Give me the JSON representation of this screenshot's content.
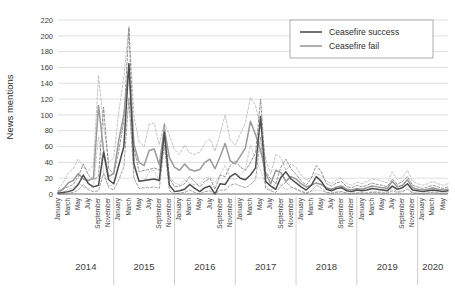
{
  "chart_data": {
    "type": "line",
    "title": "",
    "xlabel": "",
    "ylabel": "News mentions",
    "ylim": [
      0,
      220
    ],
    "ytick_step": 20,
    "yticks": [
      0,
      20,
      40,
      60,
      80,
      100,
      120,
      140,
      160,
      180,
      200,
      220
    ],
    "grid": "horizontal",
    "legend_position": "top-right",
    "legend": [
      {
        "name": "Ceasefire success",
        "color": "#4d4d4d",
        "style": "solid"
      },
      {
        "name": "Ceasefire fail",
        "color": "#9a9a9a",
        "style": "solid"
      }
    ],
    "month_tick_labels": [
      "January",
      "March",
      "May",
      "July",
      "September",
      "November"
    ],
    "year_groups": [
      {
        "year": "2014",
        "months": [
          "January",
          "March",
          "May",
          "July",
          "September",
          "November"
        ]
      },
      {
        "year": "2015",
        "months": [
          "January",
          "March",
          "May",
          "July",
          "September",
          "November"
        ]
      },
      {
        "year": "2016",
        "months": [
          "January",
          "March",
          "May",
          "July",
          "September",
          "November"
        ]
      },
      {
        "year": "2017",
        "months": [
          "January",
          "March",
          "May",
          "July",
          "September",
          "November"
        ]
      },
      {
        "year": "2018",
        "months": [
          "January",
          "March",
          "May",
          "July",
          "September",
          "November"
        ]
      },
      {
        "year": "2019",
        "months": [
          "January",
          "March",
          "May",
          "July",
          "September",
          "November"
        ]
      },
      {
        "year": "2020",
        "months": [
          "January",
          "March",
          "May"
        ]
      }
    ],
    "x_start": "2014-01",
    "x_end": "2020-06",
    "n_points": 78,
    "series": [
      {
        "name": "Ceasefire success",
        "color": "#4d4d4d",
        "style": "solid",
        "values": [
          1,
          2,
          3,
          5,
          12,
          24,
          13,
          9,
          11,
          53,
          18,
          13,
          36,
          60,
          165,
          38,
          16,
          17,
          18,
          19,
          17,
          78,
          11,
          3,
          4,
          6,
          12,
          7,
          3,
          8,
          10,
          0,
          13,
          12,
          22,
          26,
          20,
          18,
          24,
          33,
          98,
          16,
          10,
          6,
          21,
          28,
          19,
          14,
          9,
          5,
          11,
          22,
          16,
          6,
          4,
          7,
          8,
          4,
          3,
          5,
          4,
          5,
          7,
          6,
          5,
          4,
          10,
          6,
          8,
          13,
          5,
          4,
          3,
          4,
          5,
          4,
          3,
          4
        ]
      },
      {
        "name": "Ceasefire success upper CI",
        "color": "#7a7a7a",
        "style": "dashed",
        "values": [
          4,
          7,
          9,
          12,
          22,
          38,
          24,
          18,
          22,
          110,
          32,
          25,
          55,
          92,
          210,
          58,
          28,
          30,
          31,
          33,
          30,
          88,
          20,
          9,
          10,
          13,
          22,
          15,
          9,
          16,
          20,
          6,
          24,
          22,
          36,
          42,
          34,
          30,
          40,
          52,
          120,
          28,
          19,
          13,
          34,
          44,
          32,
          25,
          17,
          11,
          20,
          36,
          28,
          13,
          10,
          14,
          16,
          9,
          8,
          11,
          9,
          11,
          14,
          12,
          11,
          9,
          19,
          12,
          16,
          22,
          11,
          9,
          7,
          9,
          11,
          9,
          7,
          9
        ]
      },
      {
        "name": "Ceasefire success lower CI",
        "color": "#8d8d8d",
        "style": "dashed",
        "values": [
          0,
          0,
          1,
          2,
          5,
          12,
          5,
          3,
          4,
          26,
          8,
          5,
          18,
          34,
          122,
          20,
          7,
          8,
          8,
          9,
          7,
          62,
          4,
          0,
          1,
          2,
          5,
          2,
          0,
          3,
          4,
          0,
          5,
          5,
          11,
          13,
          10,
          8,
          12,
          18,
          72,
          7,
          4,
          2,
          10,
          15,
          9,
          6,
          3,
          1,
          4,
          11,
          7,
          2,
          1,
          2,
          3,
          1,
          0,
          1,
          1,
          1,
          2,
          2,
          1,
          1,
          4,
          2,
          3,
          6,
          1,
          1,
          0,
          1,
          2,
          1,
          0,
          1
        ]
      },
      {
        "name": "Ceasefire fail",
        "color": "#9a9a9a",
        "style": "solid",
        "values": [
          2,
          6,
          14,
          17,
          26,
          19,
          17,
          20,
          112,
          55,
          22,
          26,
          68,
          100,
          163,
          63,
          40,
          36,
          55,
          57,
          37,
          82,
          46,
          34,
          30,
          38,
          31,
          29,
          31,
          40,
          44,
          32,
          47,
          64,
          42,
          38,
          48,
          58,
          92,
          75,
          55,
          26,
          13,
          30,
          27,
          16,
          22,
          19,
          13,
          9,
          11,
          14,
          12,
          8,
          6,
          9,
          10,
          6,
          5,
          7,
          6,
          8,
          10,
          9,
          8,
          7,
          16,
          9,
          11,
          18,
          8,
          6,
          5,
          6,
          8,
          6,
          5,
          6
        ]
      },
      {
        "name": "Ceasefire fail upper CI",
        "color": "#b5b5b5",
        "style": "dashed",
        "values": [
          6,
          14,
          26,
          32,
          44,
          34,
          30,
          36,
          150,
          88,
          40,
          46,
          104,
          148,
          212,
          98,
          66,
          60,
          88,
          90,
          62,
          90,
          74,
          56,
          50,
          62,
          52,
          50,
          53,
          64,
          70,
          54,
          76,
          100,
          68,
          62,
          76,
          90,
          122,
          112,
          84,
          44,
          25,
          50,
          46,
          30,
          38,
          34,
          24,
          18,
          21,
          26,
          23,
          16,
          13,
          18,
          20,
          13,
          11,
          15,
          13,
          16,
          19,
          18,
          16,
          14,
          28,
          18,
          21,
          30,
          16,
          13,
          11,
          13,
          16,
          13,
          11,
          13
        ]
      },
      {
        "name": "Ceasefire fail lower CI",
        "color": "#c2c2c2",
        "style": "dashed",
        "values": [
          0,
          2,
          6,
          8,
          14,
          9,
          7,
          9,
          72,
          28,
          10,
          12,
          38,
          60,
          118,
          32,
          18,
          16,
          28,
          30,
          16,
          70,
          22,
          14,
          12,
          18,
          13,
          12,
          13,
          20,
          22,
          14,
          24,
          36,
          20,
          18,
          24,
          32,
          62,
          44,
          30,
          11,
          4,
          14,
          12,
          5,
          8,
          7,
          4,
          2,
          3,
          5,
          4,
          2,
          1,
          3,
          3,
          1,
          1,
          2,
          2,
          2,
          3,
          3,
          2,
          2,
          7,
          3,
          4,
          9,
          2,
          1,
          1,
          2,
          3,
          2,
          1,
          2
        ]
      }
    ]
  },
  "axis": {
    "y_title": "News mentions"
  }
}
